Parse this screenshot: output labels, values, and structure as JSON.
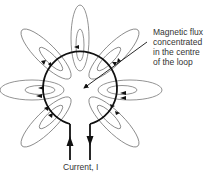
{
  "diagram": {
    "annotation": {
      "lines": [
        "Magnetic flux",
        "concentrated",
        "in the centre",
        "of the loop"
      ]
    },
    "current_label": "Current, I",
    "colors": {
      "loop": "#111111",
      "field_lines": "#777777",
      "text": "#333333"
    },
    "loop": {
      "cx": 80,
      "cy": 88,
      "r": 37
    },
    "field_line_angles_deg": [
      -90,
      -45,
      0,
      45,
      135,
      180,
      225
    ]
  }
}
